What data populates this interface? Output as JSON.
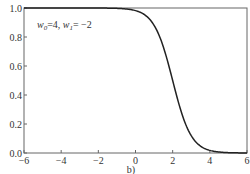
{
  "chart_data": {
    "type": "line",
    "title": "",
    "xlabel": "",
    "ylabel": "",
    "caption": "b)",
    "xlim": [
      -6,
      6
    ],
    "ylim": [
      0.0,
      1.0
    ],
    "xticks": [
      "−6",
      "−4",
      "−2",
      "0",
      "2",
      "4",
      "6"
    ],
    "yticks": [
      "0.0",
      "0.2",
      "0.4",
      "0.6",
      "0.8",
      "1.0"
    ],
    "grid": false,
    "annotation": {
      "w0_label": "w",
      "w0_sub": "0",
      "w0_val": "=4, ",
      "w1_label": "w",
      "w1_sub": "1",
      "w1_val": "= −2"
    },
    "series": [
      {
        "name": "sigmoid(w0 + w1·x), w0=4, w1=-2",
        "x": [
          -6,
          -4,
          -2,
          -1,
          0,
          0.5,
          1,
          1.5,
          2,
          2.5,
          3,
          3.5,
          4,
          5,
          6
        ],
        "y": [
          1.0,
          1.0,
          1.0,
          0.998,
          0.982,
          0.953,
          0.881,
          0.731,
          0.5,
          0.269,
          0.119,
          0.047,
          0.018,
          0.002,
          0.0
        ]
      }
    ],
    "colors": {
      "line": "#222222",
      "axes": "#666666"
    }
  }
}
